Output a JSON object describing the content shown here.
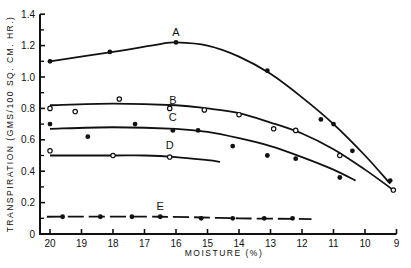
{
  "chart_data": {
    "type": "line",
    "title": "",
    "xlabel": "MOISTURE (%)",
    "ylabel": "TRANSPIRATION (GMS/100 SQ. CM. HR.)",
    "xlim": [
      20,
      9
    ],
    "ylim": [
      0,
      1.4
    ],
    "x_ticks": [
      20,
      19,
      18,
      17,
      16,
      15,
      14,
      13,
      12,
      11,
      10,
      9
    ],
    "y_ticks": [
      0,
      0.2,
      0.4,
      0.6,
      0.8,
      1.0,
      1.2,
      1.4
    ],
    "y_tick_labels": [
      "0",
      "0.2",
      "0.4",
      "0.6",
      "0.8",
      "1.0",
      "1.2",
      "1.4"
    ],
    "y_minor_ticks": [
      0.1,
      0.3,
      0.5,
      0.7,
      0.9,
      1.1,
      1.3
    ],
    "grid": false,
    "legend": "inline labels",
    "series": [
      {
        "name": "A",
        "marker": "filled",
        "points": [
          [
            20,
            1.1
          ],
          [
            18.1,
            1.16
          ],
          [
            16,
            1.22
          ],
          [
            13.1,
            1.04
          ],
          [
            11.4,
            0.73
          ],
          [
            11,
            0.7
          ],
          [
            10.4,
            0.53
          ],
          [
            9.2,
            0.34
          ]
        ],
        "curve": [
          [
            20,
            1.1
          ],
          [
            18,
            1.16
          ],
          [
            16.5,
            1.21
          ],
          [
            16,
            1.22
          ],
          [
            15,
            1.2
          ],
          [
            14,
            1.13
          ],
          [
            13,
            1.02
          ],
          [
            12,
            0.87
          ],
          [
            11,
            0.7
          ],
          [
            10,
            0.5
          ],
          [
            9.2,
            0.32
          ]
        ],
        "label_at": [
          16,
          1.26
        ]
      },
      {
        "name": "B",
        "marker": "open",
        "points": [
          [
            20,
            0.8
          ],
          [
            19.2,
            0.78
          ],
          [
            17.8,
            0.86
          ],
          [
            16.2,
            0.8
          ],
          [
            15.1,
            0.79
          ],
          [
            14,
            0.76
          ],
          [
            12.9,
            0.67
          ],
          [
            12.2,
            0.66
          ],
          [
            10.8,
            0.5
          ],
          [
            9.1,
            0.28
          ]
        ],
        "curve": [
          [
            20,
            0.82
          ],
          [
            18,
            0.83
          ],
          [
            16,
            0.82
          ],
          [
            15,
            0.8
          ],
          [
            14,
            0.77
          ],
          [
            13,
            0.71
          ],
          [
            12,
            0.64
          ],
          [
            11,
            0.54
          ],
          [
            10,
            0.41
          ],
          [
            9.1,
            0.28
          ]
        ],
        "label_at": [
          16.1,
          0.83
        ]
      },
      {
        "name": "C",
        "marker": "filled",
        "points": [
          [
            20,
            0.7
          ],
          [
            18.8,
            0.62
          ],
          [
            17.3,
            0.7
          ],
          [
            16.1,
            0.66
          ],
          [
            15.3,
            0.66
          ],
          [
            14.2,
            0.56
          ],
          [
            13.1,
            0.5
          ],
          [
            12.2,
            0.48
          ],
          [
            10.8,
            0.36
          ]
        ],
        "curve": [
          [
            20,
            0.67
          ],
          [
            18,
            0.68
          ],
          [
            16,
            0.67
          ],
          [
            15,
            0.65
          ],
          [
            14,
            0.61
          ],
          [
            13,
            0.56
          ],
          [
            12,
            0.49
          ],
          [
            11,
            0.41
          ],
          [
            10.3,
            0.34
          ]
        ],
        "label_at": [
          16.1,
          0.72
        ]
      },
      {
        "name": "D",
        "marker": "open",
        "points": [
          [
            20,
            0.53
          ],
          [
            18,
            0.5
          ],
          [
            16.2,
            0.49
          ]
        ],
        "curve": [
          [
            20,
            0.5
          ],
          [
            18,
            0.5
          ],
          [
            17,
            0.5
          ],
          [
            16,
            0.49
          ],
          [
            15,
            0.47
          ],
          [
            14.6,
            0.46
          ]
        ],
        "label_at": [
          16.2,
          0.54
        ]
      },
      {
        "name": "E",
        "marker": "filled",
        "style": "dashed",
        "points": [
          [
            19.6,
            0.11
          ],
          [
            18.4,
            0.11
          ],
          [
            17.4,
            0.11
          ],
          [
            16.5,
            0.11
          ],
          [
            15.2,
            0.1
          ],
          [
            14.2,
            0.1
          ],
          [
            13.2,
            0.1
          ],
          [
            12.3,
            0.1
          ]
        ],
        "curve": [
          [
            20.1,
            0.11
          ],
          [
            16.5,
            0.11
          ],
          [
            14,
            0.1
          ],
          [
            11.7,
            0.095
          ]
        ],
        "label_at": [
          16.5,
          0.15
        ]
      }
    ]
  }
}
